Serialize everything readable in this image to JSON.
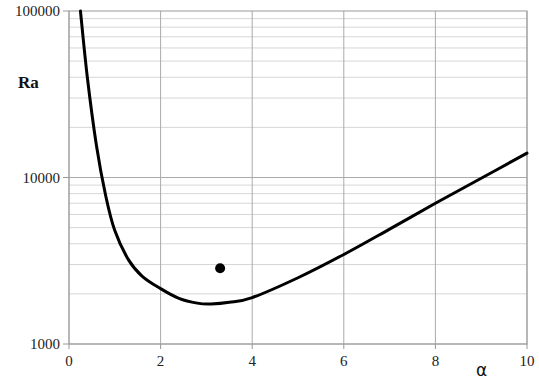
{
  "chart_data": {
    "type": "line",
    "title": "",
    "xlabel": "α",
    "ylabel": "Ra",
    "xlim": [
      0,
      10
    ],
    "ylim": [
      1000,
      100000
    ],
    "yscale": "log",
    "grid": true,
    "x_ticks": [
      "0",
      "2",
      "4",
      "6",
      "8",
      "10"
    ],
    "y_ticks": [
      "1000",
      "10000",
      "100000"
    ],
    "series": [
      {
        "name": "curve",
        "x": [
          0.25,
          0.4,
          0.6,
          0.8,
          1.0,
          1.3,
          1.6,
          2.0,
          2.4,
          2.8,
          3.1,
          3.5,
          4.0,
          5.0,
          6.0,
          7.0,
          8.0,
          9.0,
          10.0
        ],
        "y": [
          100000,
          40000,
          15500,
          7800,
          4800,
          3200,
          2550,
          2150,
          1880,
          1760,
          1740,
          1780,
          1900,
          2500,
          3450,
          4900,
          7000,
          9900,
          14000
        ]
      }
    ],
    "points": [
      {
        "name": "marker",
        "x": 3.3,
        "y": 2850
      }
    ],
    "legend": null
  }
}
